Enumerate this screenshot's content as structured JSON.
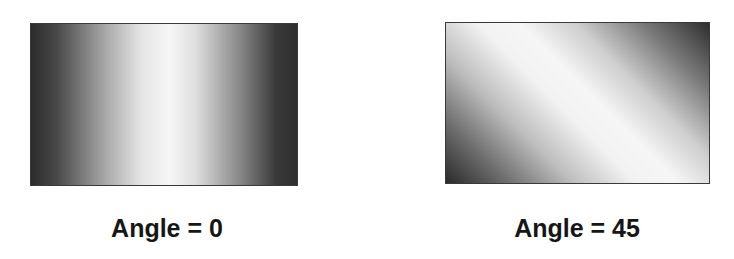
{
  "panels": [
    {
      "label": "Angle = 0",
      "gradient": {
        "angle": 0,
        "direction": "horizontal",
        "edge_color": "#2b2b2b",
        "center_color": "#f6f6f6"
      }
    },
    {
      "label": "Angle = 45",
      "gradient": {
        "angle": 45,
        "direction": "diagonal",
        "edge_color": "#2a2a2a",
        "center_color": "#f6f6f6"
      }
    }
  ]
}
